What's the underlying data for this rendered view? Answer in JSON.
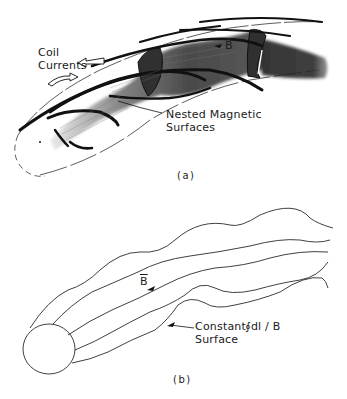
{
  "figure": {
    "panel_a": {
      "label": "(a)",
      "annotations": {
        "coil_currents_line1": "Coil",
        "coil_currents_line2": "Currents",
        "field_symbol": "B",
        "nested_surfaces_line1": "Nested Magnetic",
        "nested_surfaces_line2": "Surfaces"
      }
    },
    "panel_b": {
      "label": "(b)",
      "annotations": {
        "field_symbol": "B",
        "constant_line1": "Constant",
        "integral_expr": "∮dl / B",
        "constant_line2": "Surface"
      }
    },
    "colors": {
      "ink": "#1a1a1a",
      "background": "#ffffff",
      "shading_dark": "#2a2a2a",
      "shading_mid": "#7a7a7a"
    }
  }
}
